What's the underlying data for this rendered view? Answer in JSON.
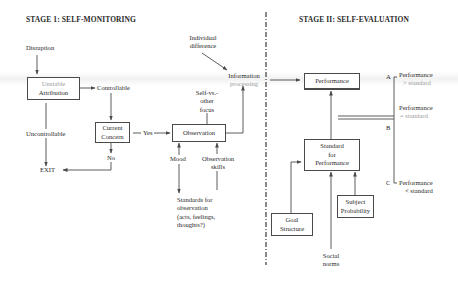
{
  "stage1": {
    "title": "STAGE 1:  SELF-MONITORING",
    "disruption": "Disruption",
    "attribution_box": {
      "line1": "Unstable",
      "line2": "Attribution"
    },
    "controllable": "Controllable",
    "uncontrollable": "Uncontrollable",
    "current_concern_box": {
      "line1": "Current",
      "line2": "Concern"
    },
    "yes": "Yes",
    "no": "No",
    "exit": "EXIT",
    "observation_box": "Observation",
    "individual_difference": {
      "line1": "Individual",
      "line2": "difference"
    },
    "information_processing": {
      "line1": "Information",
      "line2": "processing"
    },
    "self_vs_other_focus": {
      "line1": "Self-vs.-",
      "line2": "other",
      "line3": "focus"
    },
    "mood": "Mood",
    "observation_skills": {
      "line1": "Observation",
      "line2": "skills"
    },
    "standards_for_observation": {
      "line1": "Standards for",
      "line2": "observation",
      "line3": "(acts, feelings,",
      "line4": "thoughts?)"
    }
  },
  "stage2": {
    "title": "STAGE II:  SELF-EVALUATION",
    "performance_box": "Performance",
    "standard_box": {
      "line1": "Standard",
      "line2": "for",
      "line3": "Performance"
    },
    "goal_structure_box": {
      "line1": "Goal",
      "line2": "Structure"
    },
    "subject_probability_box": {
      "line1": "Subject",
      "line2": "Probability"
    },
    "social_norms": {
      "line1": "Social",
      "line2": "norms"
    },
    "outcomes": [
      {
        "letter": "A",
        "line1": "Performance",
        "line2": "> standard"
      },
      {
        "letter": "B",
        "line1": "Performance",
        "line2": "= standard"
      },
      {
        "letter": "C",
        "line1": "Performance",
        "line2": "< standard"
      }
    ]
  },
  "colors": {
    "line": "#4a4a4a",
    "text": "#2a2a2a",
    "faint_text": "#9a9a9a",
    "background": "#ffffff"
  }
}
